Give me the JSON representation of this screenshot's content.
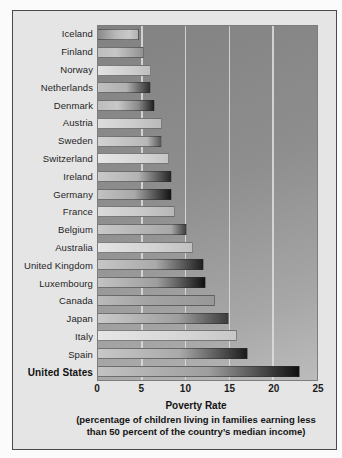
{
  "page": {
    "background": "#fbfbfb"
  },
  "figure": {
    "frame_border_color": "#4a4a4a",
    "panel_background": "#e5e5e5",
    "plot": {
      "background_gradient": [
        "#828282",
        "#bcbcbc"
      ],
      "gridline_color": "#dedede"
    },
    "axis": {
      "title": "Poverty Rate",
      "caption_line1": "(percentage of children living in families earning less",
      "caption_line2": "than 50 percent of the country’s median income)"
    }
  },
  "chart_data": {
    "type": "bar",
    "orientation": "horizontal",
    "xlabel": "Poverty Rate",
    "xlabel_note": "(percentage of children living in families earning less than 50 percent of the country’s median income)",
    "xlim": [
      0,
      25
    ],
    "x_ticks": [
      0,
      5,
      10,
      15,
      20,
      25
    ],
    "gridlines_at": [
      5,
      10,
      15,
      20
    ],
    "grid": true,
    "legend": false,
    "emphasized_category": "United States",
    "categories": [
      "Iceland",
      "Finland",
      "Norway",
      "Netherlands",
      "Denmark",
      "Austria",
      "Sweden",
      "Switzerland",
      "Ireland",
      "Germany",
      "France",
      "Belgium",
      "Australia",
      "United Kingdom",
      "Luxembourg",
      "Canada",
      "Japan",
      "Italy",
      "Spain",
      "United States"
    ],
    "values": [
      4.7,
      5.3,
      6.1,
      6.1,
      6.5,
      7.3,
      7.3,
      8.1,
      8.4,
      8.5,
      8.8,
      10.2,
      10.9,
      12.1,
      12.3,
      13.3,
      14.9,
      15.9,
      17.1,
      23.1
    ],
    "bar_styles": [
      "linear-gradient(90deg,#8a8a8a 0%,#b9b9b9 45%,#c9c9c9 78%,#b2b2b2 100%)",
      "linear-gradient(90deg,#bdbdbd 0%,#c6c6c6 40%,#929292 100%)",
      "linear-gradient(90deg,#e2e2e2 0%,#cfcfcf 60%,#bfbfbf 100%)",
      "linear-gradient(90deg,#c0c0c0 0%,#b0b0b0 55%,#2e2e2e 100%)",
      "linear-gradient(90deg,#bcbcbc 0%,#c8c8c8 35%,#8a8a8a 72%,#1d1d1d 100%)",
      "linear-gradient(90deg,#dcdcdc 0%,#cccccc 55%,#b9b9b9 100%)",
      "linear-gradient(90deg,#d2d2d2 0%,#b8b8b8 78%,#565656 100%)",
      "linear-gradient(90deg,#e6e6e6 0%,#d6d6d6 60%,#c5c5c5 100%)",
      "linear-gradient(90deg,#c9c9c9 0%,#b3b3b3 55%,#252525 100%)",
      "linear-gradient(90deg,#c2c2c2 0%,#a8a8a8 50%,#121212 100%)",
      "linear-gradient(90deg,#dadada 0%,#cacaca 55%,#b7b7b7 100%)",
      "linear-gradient(90deg,#c8c8c8 0%,#a8a8a8 83%,#3e3e3e 100%)",
      "linear-gradient(90deg,#e4e4e4 0%,#d2d2d2 60%,#c1c1c1 100%)",
      "linear-gradient(90deg,#c6c6c6 0%,#aaaaaa 55%,#1e1e1e 100%)",
      "linear-gradient(90deg,#c3c3c3 0%,#9e9e9e 55%,#101010 100%)",
      "linear-gradient(90deg,#bababa 0%,#a3a3a3 45%,#989898 100%)",
      "linear-gradient(90deg,#cacaca 0%,#9e9e9e 62%,#3c3c3c 100%)",
      "linear-gradient(90deg,#e6e6e6 0%,#d8d8d8 55%,#c7c7c7 100%)",
      "linear-gradient(90deg,#c8c8c8 0%,#a9a9a9 55%,#1b1b1b 100%)",
      "linear-gradient(90deg,#c2c2c2 0%,#9e9e9e 55%,#0f0f0f 100%)"
    ]
  }
}
